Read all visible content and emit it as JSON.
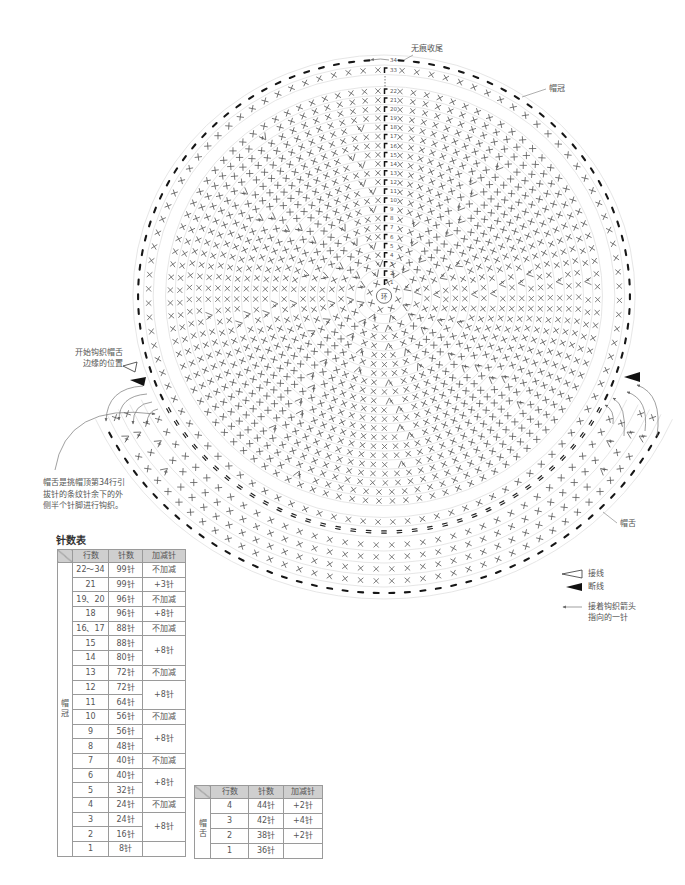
{
  "labels": {
    "finish": "无痕收尾",
    "crown": "帽冠",
    "brim": "帽舌",
    "brim_start": [
      "开始钩织帽舌",
      "边缘的位置"
    ],
    "brim_note": [
      "帽舌是挑帽顶第34行引",
      "拔针的条纹针余下的外",
      "侧半个针脚进行钩织。"
    ]
  },
  "diagram": {
    "center_label": "环",
    "row_labels": [
      "34",
      "33",
      "22",
      "21",
      "20",
      "19",
      "18",
      "17",
      "16",
      "15",
      "14",
      "13",
      "12",
      "11",
      "10",
      "9",
      "8",
      "7",
      "6",
      "5",
      "4",
      "3",
      "2",
      "1"
    ],
    "crown_rows": [
      {
        "row": 1,
        "stitches": 8,
        "increase": 0
      },
      {
        "row": 2,
        "stitches": 16,
        "increase": 8
      },
      {
        "row": 3,
        "stitches": 24,
        "increase": 8
      },
      {
        "row": 4,
        "stitches": 24,
        "increase": 0
      },
      {
        "row": 5,
        "stitches": 32,
        "increase": 8
      },
      {
        "row": 6,
        "stitches": 40,
        "increase": 8
      },
      {
        "row": 7,
        "stitches": 40,
        "increase": 0
      },
      {
        "row": 8,
        "stitches": 48,
        "increase": 8
      },
      {
        "row": 9,
        "stitches": 56,
        "increase": 8
      },
      {
        "row": 10,
        "stitches": 56,
        "increase": 0
      },
      {
        "row": 11,
        "stitches": 64,
        "increase": 8
      },
      {
        "row": 12,
        "stitches": 72,
        "increase": 8
      },
      {
        "row": 13,
        "stitches": 72,
        "increase": 0
      },
      {
        "row": 14,
        "stitches": 80,
        "increase": 8
      },
      {
        "row": 15,
        "stitches": 88,
        "increase": 8
      },
      {
        "row": 16,
        "stitches": 88,
        "increase": 0
      },
      {
        "row": 17,
        "stitches": 88,
        "increase": 0
      },
      {
        "row": 18,
        "stitches": 96,
        "increase": 8
      },
      {
        "row": 19,
        "stitches": 96,
        "increase": 0
      },
      {
        "row": 20,
        "stitches": 96,
        "increase": 0
      },
      {
        "row": 21,
        "stitches": 99,
        "increase": 3
      },
      {
        "row": 22,
        "stitches": 99,
        "increase": 0
      }
    ],
    "crown_outer_rows": [
      {
        "row": 33,
        "stitches": 99
      },
      {
        "row": 34,
        "stitches": 99
      }
    ],
    "brim_rows": [
      {
        "row": 1,
        "stitches": 36,
        "increase": 0
      },
      {
        "row": 2,
        "stitches": 38,
        "increase": 2
      },
      {
        "row": 3,
        "stitches": 42,
        "increase": 4
      },
      {
        "row": 4,
        "stitches": 44,
        "increase": 2
      }
    ]
  },
  "legend": [
    {
      "icon": "join-yarn-white-triangle",
      "label": "接线"
    },
    {
      "icon": "cut-yarn-black-triangle",
      "label": "断线"
    },
    {
      "icon": "arrow-left",
      "label": "接着钩织箭头",
      "label2": "指向的一针"
    }
  ],
  "crown_table": {
    "title": "针数表",
    "section": "帽冠",
    "headers": [
      "行数",
      "针数",
      "加减针"
    ],
    "rows": [
      {
        "rows": "22～34",
        "stitches": "99针",
        "change": "不加减"
      },
      {
        "rows": "21",
        "stitches": "99针",
        "change": "+3针"
      },
      {
        "rows": "19、20",
        "stitches": "96针",
        "change": "不加减"
      },
      {
        "rows": "18",
        "stitches": "96针",
        "change": "+8针"
      },
      {
        "rows": "16、17",
        "stitches": "88针",
        "change": "不加减"
      },
      {
        "rows": "15",
        "stitches": "88针",
        "change": "+8针",
        "span": 2
      },
      {
        "rows": "14",
        "stitches": "80针"
      },
      {
        "rows": "13",
        "stitches": "72针",
        "change": "不加减"
      },
      {
        "rows": "12",
        "stitches": "72针",
        "change": "+8针",
        "span": 2
      },
      {
        "rows": "11",
        "stitches": "64针"
      },
      {
        "rows": "10",
        "stitches": "56针",
        "change": "不加减"
      },
      {
        "rows": "9",
        "stitches": "56针",
        "change": "+8针",
        "span": 2
      },
      {
        "rows": "8",
        "stitches": "48针"
      },
      {
        "rows": "7",
        "stitches": "40针",
        "change": "不加减"
      },
      {
        "rows": "6",
        "stitches": "40针",
        "change": "+8针",
        "span": 2
      },
      {
        "rows": "5",
        "stitches": "32针"
      },
      {
        "rows": "4",
        "stitches": "24针",
        "change": "不加减"
      },
      {
        "rows": "3",
        "stitches": "24针",
        "change": "+8针",
        "span": 2
      },
      {
        "rows": "2",
        "stitches": "16针"
      },
      {
        "rows": "1",
        "stitches": "8针",
        "change": ""
      }
    ]
  },
  "brim_table": {
    "section": "帽舌",
    "headers": [
      "行数",
      "针数",
      "加减针"
    ],
    "rows": [
      {
        "rows": "4",
        "stitches": "44针",
        "change": "+2针"
      },
      {
        "rows": "3",
        "stitches": "42针",
        "change": "+4针"
      },
      {
        "rows": "2",
        "stitches": "38针",
        "change": "+2针"
      },
      {
        "rows": "1",
        "stitches": "36针",
        "change": ""
      }
    ]
  }
}
